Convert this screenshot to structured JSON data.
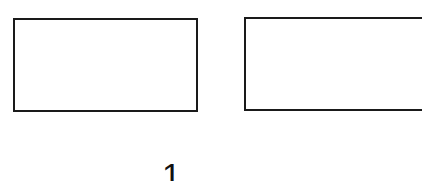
{
  "figure": {
    "boxes": [
      {
        "label": ""
      },
      {
        "label": ""
      }
    ],
    "caption": {
      "number": "1",
      "rest": " ..."
    },
    "colors": {
      "stroke": "#1a1a1a",
      "background": "#ffffff",
      "text": "#111111"
    }
  }
}
